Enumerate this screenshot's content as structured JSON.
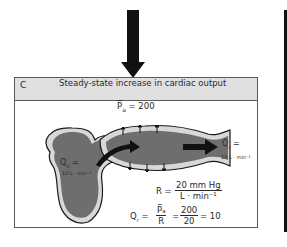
{
  "panel": {
    "letter": "C",
    "title": "Steady-state increase in cardiac output"
  },
  "labels": {
    "pa": "P̅ₐ = 200",
    "pa_symbol": "P",
    "pa_sub": "a",
    "pa_value": "= 200",
    "qh_symbol": "Q",
    "qh_sub": "h",
    "qh_eq": "=",
    "qh_value": "10 L · min⁻¹",
    "qr_symbol": "Q",
    "qr_sub": "r",
    "qr_eq": "=",
    "qr_value": "10 L · min⁻¹"
  },
  "equations": {
    "resistance": {
      "lhs": "R =",
      "numerator": "20 mm Hg",
      "denominator": "L · min⁻¹"
    },
    "flow": {
      "lhs": "Q",
      "lhs_sub": "r",
      "eq1": "=",
      "frac1_num": "P̅ₐ",
      "frac1_den": "R",
      "eq2": "=",
      "frac2_num": "200",
      "frac2_den": "20",
      "result": "= 10"
    }
  },
  "colors": {
    "fluid": "#6e6e6e",
    "vessel_wall": "#d8d8d8",
    "outline": "#1a1a1a",
    "header_bg": "#e0e0e0",
    "arrow": "#111111"
  }
}
